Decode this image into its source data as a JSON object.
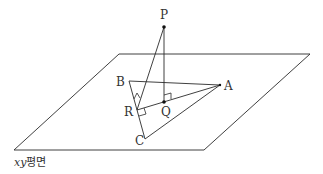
{
  "diagram": {
    "plane_label_var": "xy",
    "plane_label_word": "평면",
    "points": {
      "P": {
        "label": "P"
      },
      "A": {
        "label": "A"
      },
      "B": {
        "label": "B"
      },
      "C": {
        "label": "C"
      },
      "Q": {
        "label": "Q"
      },
      "R": {
        "label": "R"
      }
    },
    "colors": {
      "stroke": "#2a2a2a",
      "text": "#333333"
    }
  }
}
